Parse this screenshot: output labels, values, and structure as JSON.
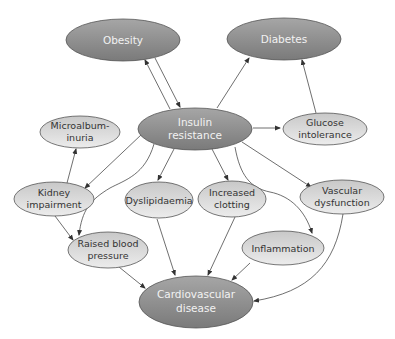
{
  "diagram": {
    "type": "flow-diagram",
    "colors": {
      "dark_node_fill": "#8c8c8c",
      "light_node_fill": "#dcdcdc",
      "stroke": "#555555",
      "edge": "#4a4a4a",
      "dark_text": "#f2f2f2",
      "light_text": "#333333"
    },
    "nodes": {
      "obesity": {
        "lines": [
          "Obesity"
        ]
      },
      "diabetes": {
        "lines": [
          "Diabetes"
        ]
      },
      "insulin": {
        "lines": [
          "Insulin",
          "resistance"
        ]
      },
      "microalb": {
        "lines": [
          "Microalbum-",
          "inuria"
        ]
      },
      "glucose": {
        "lines": [
          "Glucose",
          "intolerance"
        ]
      },
      "kidney": {
        "lines": [
          "Kidney",
          "impairment"
        ]
      },
      "dyslip": {
        "lines": [
          "Dyslipidaemia"
        ]
      },
      "clotting": {
        "lines": [
          "Increased",
          "clotting"
        ]
      },
      "vascular": {
        "lines": [
          "Vascular",
          "dysfunction"
        ]
      },
      "bp": {
        "lines": [
          "Raised blood",
          "pressure"
        ]
      },
      "inflam": {
        "lines": [
          "Inflammation"
        ]
      },
      "cvd": {
        "lines": [
          "Cardiovascular",
          "disease"
        ]
      }
    },
    "edges": [
      [
        "obesity",
        "insulin"
      ],
      [
        "insulin",
        "obesity"
      ],
      [
        "insulin",
        "diabetes"
      ],
      [
        "insulin",
        "glucose"
      ],
      [
        "glucose",
        "diabetes"
      ],
      [
        "insulin",
        "kidney"
      ],
      [
        "insulin",
        "bp"
      ],
      [
        "insulin",
        "dyslip"
      ],
      [
        "insulin",
        "clotting"
      ],
      [
        "insulin",
        "vascular"
      ],
      [
        "insulin",
        "inflam"
      ],
      [
        "kidney",
        "microalb"
      ],
      [
        "kidney",
        "bp"
      ],
      [
        "bp",
        "cvd"
      ],
      [
        "dyslip",
        "cvd"
      ],
      [
        "clotting",
        "cvd"
      ],
      [
        "inflam",
        "cvd"
      ],
      [
        "vascular",
        "cvd"
      ]
    ]
  }
}
